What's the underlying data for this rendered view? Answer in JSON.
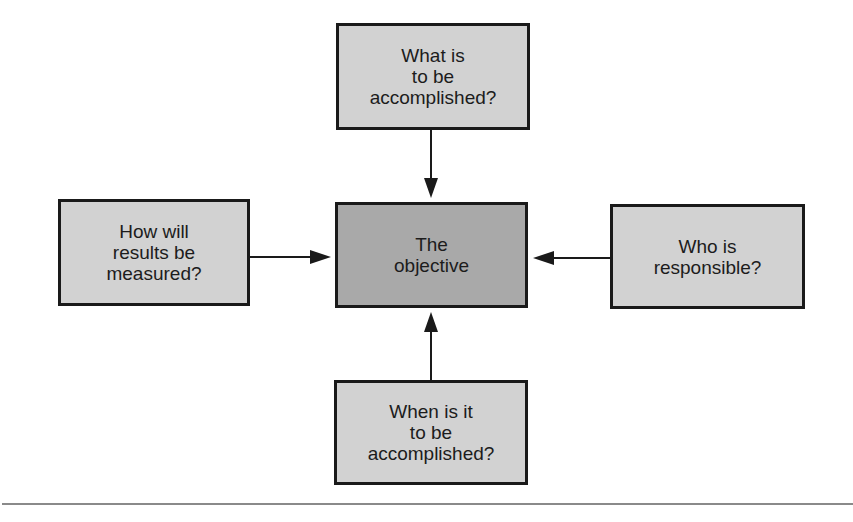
{
  "diagram": {
    "center": {
      "label": "The\nobjective",
      "fill": "#a9a9a9"
    },
    "nodes": {
      "top": {
        "label": "What is\nto be\naccomplished?",
        "fill": "#d2d2d2"
      },
      "left": {
        "label": "How will\nresults be\nmeasured?",
        "fill": "#d2d2d2"
      },
      "right": {
        "label": "Who is\nresponsible?",
        "fill": "#d2d2d2"
      },
      "bottom": {
        "label": "When is it\nto be\naccomplished?",
        "fill": "#d2d2d2"
      }
    },
    "edges": [
      {
        "from": "top",
        "to": "center"
      },
      {
        "from": "left",
        "to": "center"
      },
      {
        "from": "right",
        "to": "center"
      },
      {
        "from": "bottom",
        "to": "center"
      }
    ]
  }
}
